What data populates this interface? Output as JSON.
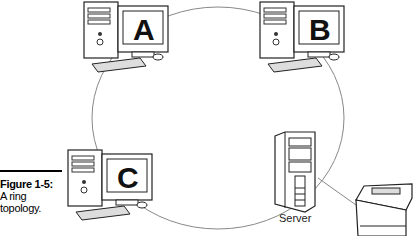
{
  "figure": {
    "caption_title": "Figure 1-5:",
    "caption_text_line1": "A ring",
    "caption_text_line2": "topology."
  },
  "nodes": [
    {
      "id": "A",
      "label": "A",
      "type": "workstation"
    },
    {
      "id": "B",
      "label": "B",
      "type": "workstation"
    },
    {
      "id": "C",
      "label": "C",
      "type": "workstation"
    },
    {
      "id": "server",
      "label": "Server",
      "type": "server"
    },
    {
      "id": "printer",
      "label": "",
      "type": "printer"
    }
  ],
  "topology": "ring",
  "colors": {
    "line": "#888888",
    "outline": "#222222",
    "fill": "#ffffff",
    "shade": "#dddddd"
  }
}
